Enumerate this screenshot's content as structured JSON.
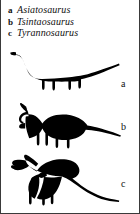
{
  "figure": {
    "background_color": "#ffffff",
    "silhouette_color": "#000000",
    "border_color": "#3a3a3a"
  },
  "legend": {
    "entries": [
      {
        "key": "a",
        "name": "Asiatosaurus"
      },
      {
        "key": "b",
        "name": "Tsintaosaurus"
      },
      {
        "key": "c",
        "name": "Tyrannosaurus"
      }
    ]
  },
  "panels": [
    {
      "label": "a",
      "taxon": "Asiatosaurus",
      "icon": "sauropod-silhouette-icon",
      "description": "long-necked long-tailed quadrupedal sauropod silhouette facing left"
    },
    {
      "label": "b",
      "taxon": "Tsintaosaurus",
      "icon": "hadrosaur-silhouette-icon",
      "description": "crested hadrosaur silhouette facing left with long tapering tail"
    },
    {
      "label": "c",
      "taxon": "Tyrannosaurus",
      "icon": "theropod-silhouette-icon",
      "description": "bipedal theropod silhouette facing left with open jaws and long tail"
    }
  ]
}
